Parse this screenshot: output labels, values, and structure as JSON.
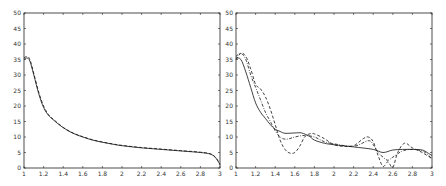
{
  "chart_data": [
    {
      "type": "line",
      "title": "",
      "xlabel": "",
      "ylabel": "",
      "xlim": [
        1,
        3
      ],
      "ylim": [
        0,
        50
      ],
      "xticks": [
        1,
        1.2,
        1.4,
        1.6,
        1.8,
        2,
        2.2,
        2.4,
        2.6,
        2.8,
        3
      ],
      "xtick_labels": [
        "1",
        "1.2",
        "1.4",
        "1.6",
        "1.8",
        "2",
        "2.2",
        "2.4",
        "2.6",
        "2.8",
        "3"
      ],
      "yticks": [
        0,
        5,
        10,
        15,
        20,
        25,
        30,
        35,
        40,
        45,
        50
      ],
      "ytick_labels": [
        "0",
        "5",
        "10",
        "15",
        "20",
        "25",
        "30",
        "35",
        "40",
        "45",
        "50"
      ],
      "grid": false,
      "legend": null,
      "series": [
        {
          "name": "solid",
          "style": "solid",
          "x": [
            1.0,
            1.03,
            1.06,
            1.1,
            1.15,
            1.2,
            1.25,
            1.3,
            1.4,
            1.5,
            1.6,
            1.7,
            1.8,
            1.9,
            2.0,
            2.2,
            2.4,
            2.6,
            2.8,
            2.9,
            2.95,
            2.98,
            3.0
          ],
          "y": [
            35,
            35.5,
            34.5,
            30,
            24,
            19.5,
            17,
            15.5,
            13,
            11.2,
            10,
            9,
            8.3,
            7.7,
            7.2,
            6.5,
            6,
            5.5,
            5,
            4.5,
            3.5,
            2.2,
            1
          ]
        },
        {
          "name": "dashed",
          "style": "dashed",
          "x": [
            1.0,
            1.03,
            1.06,
            1.1,
            1.15,
            1.2,
            1.25,
            1.3,
            1.4,
            1.5,
            1.6,
            1.7,
            1.8,
            1.9,
            2.0,
            2.2,
            2.4,
            2.6,
            2.8,
            2.9,
            2.95,
            2.98,
            3.0
          ],
          "y": [
            35.5,
            36,
            35,
            30.5,
            24.5,
            20,
            17.2,
            15.7,
            13.1,
            11.3,
            10.1,
            9.1,
            8.4,
            7.8,
            7.3,
            6.6,
            6.1,
            5.6,
            5.1,
            4.6,
            3.6,
            2.3,
            1.2
          ]
        }
      ]
    },
    {
      "type": "line",
      "title": "",
      "xlabel": "",
      "ylabel": "",
      "xlim": [
        1,
        3
      ],
      "ylim": [
        0,
        50
      ],
      "xticks": [
        1,
        1.2,
        1.4,
        1.6,
        1.8,
        2,
        2.2,
        2.4,
        2.6,
        2.8,
        3
      ],
      "xtick_labels": [
        "1",
        "1.2",
        "1.4",
        "1.6",
        "1.8",
        "2",
        "2.2",
        "2.4",
        "2.6",
        "2.8",
        "3"
      ],
      "yticks": [
        0,
        5,
        10,
        15,
        20,
        25,
        30,
        35,
        40,
        45,
        50
      ],
      "ytick_labels": [
        "0",
        "5",
        "10",
        "15",
        "20",
        "25",
        "30",
        "35",
        "40",
        "45",
        "50"
      ],
      "grid": false,
      "legend": null,
      "series": [
        {
          "name": "solid",
          "style": "solid",
          "x": [
            1.0,
            1.05,
            1.1,
            1.15,
            1.2,
            1.25,
            1.3,
            1.35,
            1.4,
            1.45,
            1.5,
            1.6,
            1.67,
            1.75,
            1.8,
            1.9,
            2.0,
            2.2,
            2.4,
            2.5,
            2.6,
            2.7,
            2.8,
            2.9,
            2.95,
            3.0
          ],
          "y": [
            35.5,
            35,
            31,
            26,
            21,
            18,
            16,
            14,
            12.5,
            11.8,
            11.2,
            11.3,
            11.3,
            10.2,
            9,
            8,
            7.5,
            6.8,
            6,
            5,
            5.8,
            6,
            6,
            5.8,
            5,
            4
          ]
        },
        {
          "name": "dashed",
          "style": "dashed",
          "x": [
            1.0,
            1.05,
            1.1,
            1.15,
            1.2,
            1.25,
            1.3,
            1.35,
            1.4,
            1.45,
            1.5,
            1.55,
            1.6,
            1.65,
            1.7,
            1.75,
            1.8,
            1.9,
            2.0,
            2.1,
            2.2,
            2.3,
            2.35,
            2.4,
            2.45,
            2.5,
            2.55,
            2.6,
            2.65,
            2.72,
            2.8,
            2.9,
            3.0
          ],
          "y": [
            35,
            37,
            36,
            32,
            27,
            25.5,
            23,
            19,
            14,
            9,
            6,
            4.8,
            5,
            7,
            10,
            11,
            11,
            9.5,
            7.5,
            7,
            7.2,
            9.5,
            10,
            8.5,
            4,
            0.5,
            2,
            0.2,
            5,
            8,
            6.5,
            5,
            3
          ]
        },
        {
          "name": "dash-dot",
          "style": "dashdot",
          "x": [
            1.0,
            1.05,
            1.1,
            1.15,
            1.2,
            1.25,
            1.3,
            1.35,
            1.4,
            1.45,
            1.5,
            1.55,
            1.6,
            1.7,
            1.8,
            1.9,
            2.0,
            2.2,
            2.35,
            2.4,
            2.45,
            2.5,
            2.55,
            2.6,
            2.7,
            2.8,
            2.9,
            2.95,
            3.0
          ],
          "y": [
            36,
            37,
            35,
            30,
            26,
            22,
            18,
            15,
            12,
            10,
            9.3,
            9.5,
            10,
            10.5,
            10,
            8.5,
            7.8,
            7,
            8.8,
            7.5,
            5,
            3.5,
            2.5,
            3.5,
            5.5,
            6,
            5.5,
            4.5,
            3
          ]
        }
      ]
    }
  ]
}
